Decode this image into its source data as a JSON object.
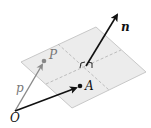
{
  "diagram": {
    "labels": {
      "normal": "n",
      "point_P": "P",
      "vector_p": "p",
      "point_A": "A",
      "origin": "O"
    },
    "colors": {
      "plane_fill": "#ececec",
      "plane_edge": "#c8c8c8",
      "dash": "#b0b0b0",
      "black": "#111111",
      "gray_vector": "#8a8a8a",
      "gray_point": "#888888"
    }
  }
}
